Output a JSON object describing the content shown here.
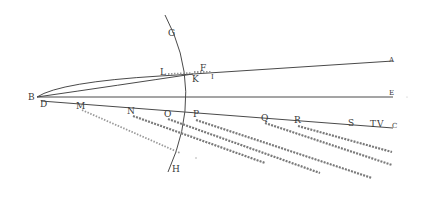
{
  "figure": {
    "type": "geometric optics diagram",
    "colors": {
      "ink": "#4a4a4a",
      "hatch": "#7a7a7a",
      "background": "#ffffff"
    },
    "labels": {
      "A": "A",
      "B": "B",
      "C": "C",
      "D": "D",
      "E": "E",
      "F": "F",
      "G": "G",
      "H": "H",
      "I": "I",
      "K": "K",
      "L": "L",
      "M": "M",
      "N": "N",
      "O": "O",
      "P": "P",
      "Q": "Q",
      "R": "R",
      "S": "S",
      "T": "T",
      "V": "V"
    },
    "label_positions": {
      "G": [
        157,
        36
      ],
      "F": [
        201,
        71
      ],
      "L": [
        163,
        75
      ],
      "K": [
        193,
        82
      ],
      "I": [
        214,
        78
      ],
      "A": [
        390,
        61
      ],
      "E": [
        390,
        94
      ],
      "B": [
        29,
        100
      ],
      "D": [
        41,
        106
      ],
      "M": [
        78,
        107
      ],
      "N": [
        129,
        115
      ],
      "O": [
        165,
        117
      ],
      "P": [
        193,
        117
      ],
      "Q": [
        262,
        121
      ],
      "R": [
        296,
        123
      ],
      "S": [
        349,
        126
      ],
      "T": [
        372,
        127
      ],
      "V": [
        380,
        127
      ],
      "C": [
        393,
        128
      ],
      "H": [
        174,
        172
      ]
    },
    "lines": [
      {
        "name": "arc-GH",
        "from": "G",
        "to": "H"
      },
      {
        "name": "line-BA",
        "from": "B",
        "to": "A"
      },
      {
        "name": "line-BE",
        "from": "B",
        "to": "E"
      },
      {
        "name": "line-DC",
        "from": "D",
        "to": "C"
      }
    ],
    "hatched_rays": [
      {
        "from": "M",
        "to_xy": [
          180,
          153
        ]
      },
      {
        "from": "N",
        "to_xy": [
          265,
          163
        ]
      },
      {
        "from": "O",
        "to_xy": [
          320,
          173
        ]
      },
      {
        "from": "P",
        "to_xy": [
          372,
          178
        ]
      },
      {
        "from": "Q",
        "to_xy": [
          392,
          165
        ]
      },
      {
        "from": "R",
        "to_xy": [
          392,
          152
        ]
      }
    ]
  }
}
